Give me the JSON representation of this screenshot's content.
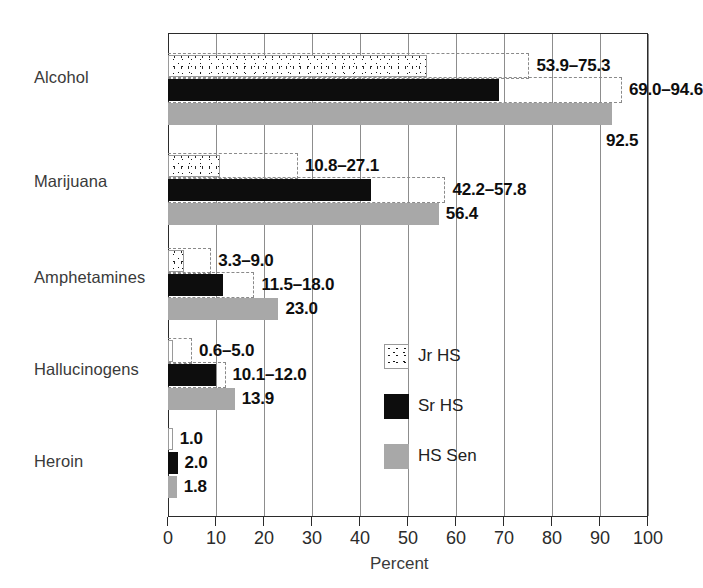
{
  "chart_data": {
    "type": "bar",
    "orientation": "horizontal",
    "title": "",
    "xlabel": "Percent",
    "ylabel": "",
    "xlim": [
      0,
      100
    ],
    "xticks": [
      "0",
      "10",
      "20",
      "30",
      "40",
      "50",
      "60",
      "70",
      "80",
      "90",
      "100"
    ],
    "grid": "vertical",
    "legend_position": "center-right",
    "categories": [
      "Alcohol",
      "Marijuana",
      "Amphetamines",
      "Hallucinogens",
      "Heroin"
    ],
    "series": [
      {
        "name": "Jr HS",
        "style": "stippled",
        "values": [
          53.9,
          10.8,
          3.3,
          0.6,
          1.0
        ],
        "upper_values": [
          75.3,
          27.1,
          9.0,
          5.0,
          1.0
        ],
        "labels": [
          "53.9-75.3",
          "10.8-27.1",
          "3.3-9.0",
          "0.6-5.0",
          "1.0"
        ]
      },
      {
        "name": "Sr HS",
        "style": "black",
        "values": [
          69.0,
          42.2,
          11.5,
          10.1,
          2.0
        ],
        "upper_values": [
          94.6,
          57.8,
          18.0,
          12.0,
          2.0
        ],
        "labels": [
          "69.0-94.6",
          "42.2-57.8",
          "11.5-18.0",
          "10.1-12.0",
          "2.0"
        ]
      },
      {
        "name": "HS Sen",
        "style": "gray",
        "values": [
          92.5,
          56.4,
          23.0,
          13.9,
          1.8
        ],
        "upper_values": [
          92.5,
          56.4,
          23.0,
          13.9,
          1.8
        ],
        "labels": [
          "92.5",
          "56.4",
          "23.0",
          "13.9",
          "1.8"
        ]
      }
    ],
    "colors": {
      "jr_hs": "#ffffff",
      "sr_hs": "#0d0d0d",
      "hs_sen": "#a8a8a8",
      "bracket": "#8a8a8a",
      "axis": "#2b2b2b",
      "grid": "#8d8d8d"
    }
  },
  "axis": {
    "x_title": "Percent",
    "ticks": [
      "0",
      "10",
      "20",
      "30",
      "40",
      "50",
      "60",
      "70",
      "80",
      "90",
      "100"
    ]
  },
  "categories": {
    "alcohol": "Alcohol",
    "marijuana": "Marijuana",
    "amphetamines": "Amphetamines",
    "hallucinogens": "Hallucinogens",
    "heroin": "Heroin"
  },
  "legend": {
    "items": [
      {
        "label": "Jr HS",
        "style": "jr"
      },
      {
        "label": "Sr HS",
        "style": "sr"
      },
      {
        "label": "HS Sen",
        "style": "sen"
      }
    ]
  },
  "values": {
    "alcohol": {
      "jr": "53.9-75.3",
      "sr": "69.0-94.6",
      "sen": "92.5"
    },
    "marijuana": {
      "jr": "10.8-27.1",
      "sr": "42.2-57.8",
      "sen": "56.4"
    },
    "amphetamines": {
      "jr": "3.3-9.0",
      "sr": "11.5-18.0",
      "sen": "23.0"
    },
    "hallucinogens": {
      "jr": "0.6-5.0",
      "sr": "10.1-12.0",
      "sen": "13.9"
    },
    "heroin": {
      "jr": "1.0",
      "sr": "2.0",
      "sen": "1.8"
    }
  }
}
